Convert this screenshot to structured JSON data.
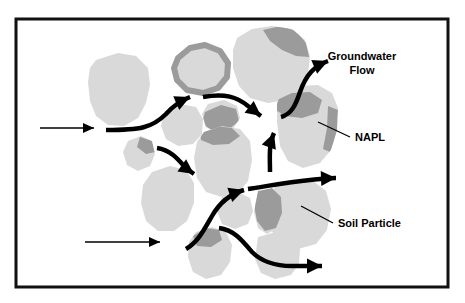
{
  "figure": {
    "border": {
      "color": "#111111",
      "fill": "#ffffff",
      "x": 16,
      "y": 19,
      "width": 432,
      "height": 268,
      "stroke_width": 3
    },
    "colors": {
      "soil_particle": "#d9d9d9",
      "napl": "#9b9b9b",
      "arrow": "#000000",
      "leader_line": "#000000",
      "text": "#000000",
      "background": "#ffffff"
    }
  },
  "labels": [
    {
      "name": "groundwater-flow",
      "lines": [
        "Groundwater",
        "Flow"
      ],
      "line1": "Groundwater",
      "line2": "Flow",
      "x": 362,
      "y": 60,
      "font_size": 11,
      "anchor": "middle",
      "has_leader": false
    },
    {
      "name": "napl",
      "line1": "NAPL",
      "x": 355,
      "y": 141,
      "font_size": 11,
      "anchor": "start",
      "has_leader": true,
      "leader": {
        "x1": 350,
        "y1": 137,
        "x2": 318,
        "y2": 122
      }
    },
    {
      "name": "soil-particle",
      "line1": "Soil Particle",
      "x": 338,
      "y": 227,
      "font_size": 11,
      "anchor": "start",
      "has_leader": true,
      "leader": {
        "x1": 333,
        "y1": 223,
        "x2": 301,
        "y2": 206
      }
    }
  ],
  "soil_particles": [
    {
      "name": "particle-left-large",
      "path": "M 96,60 L 118,53 L 136,56 L 148,68 L 150,85 L 146,103 L 138,118 L 124,126 L 108,125 L 96,116 L 90,101 L 88,82 L 90,68 Z",
      "napl_patches": []
    },
    {
      "name": "particle-top-coated-ring",
      "path": "M 178,58 L 190,48 L 205,45 L 220,51 L 228,63 L 227,77 L 218,88 L 203,93 L 187,90 L 177,80 L 174,68 Z",
      "napl_patches": [
        {
          "name": "napl-ring-coating",
          "type": "ring",
          "path": "M 178,58 L 190,48 L 205,45 L 220,51 L 228,63 L 227,77 L 218,88 L 203,93 L 187,90 L 177,80 L 174,68 Z"
        }
      ]
    },
    {
      "name": "particle-top-right-large",
      "path": "M 237,38 L 252,29 L 272,26 L 292,29 L 305,40 L 310,56 L 308,75 L 300,90 L 286,100 L 268,103 L 250,98 L 239,86 L 233,68 L 233,50 Z",
      "napl_patches": [
        {
          "name": "napl-top-right-cap",
          "type": "patch",
          "path": "M 263,30 L 281,26 L 296,31 L 306,43 L 309,57 L 296,56 L 282,50 L 270,41 Z"
        }
      ]
    },
    {
      "name": "particle-center-small",
      "path": "M 165,111 L 180,104 L 196,107 L 203,119 L 202,134 L 193,144 L 178,146 L 166,139 L 161,126 Z",
      "napl_patches": []
    },
    {
      "name": "particle-center-blob",
      "path": "M 208,104 L 224,100 L 237,106 L 240,118 L 233,129 L 218,133 L 206,127 L 202,114 Z",
      "napl_patches": [
        {
          "name": "napl-center-bridge",
          "type": "patch",
          "path": "M 205,112 L 221,105 L 236,109 L 239,121 L 228,130 L 212,131 L 202,123 Z"
        }
      ]
    },
    {
      "name": "particle-center-large",
      "path": "M 204,132 L 222,126 L 240,129 L 250,141 L 252,160 L 248,181 L 238,193 L 222,197 L 206,192 L 197,178 L 194,158 L 197,142 Z",
      "napl_patches": [
        {
          "name": "napl-center-large-top",
          "type": "patch",
          "path": "M 200,131 L 216,126 L 232,128 L 240,136 L 229,144 L 213,145 L 201,140 Z"
        }
      ]
    },
    {
      "name": "particle-left-small-mid",
      "path": "M 128,141 L 141,136 L 152,141 L 155,154 L 150,166 L 138,171 L 127,165 L 123,152 Z",
      "napl_patches": [
        {
          "name": "napl-left-small-wedge",
          "type": "patch",
          "path": "M 140,137 L 152,141 L 155,152 L 146,154 L 137,147 Z"
        }
      ]
    },
    {
      "name": "particle-lower-left-large",
      "path": "M 152,172 L 170,166 L 186,170 L 194,183 L 194,203 L 187,221 L 174,231 L 158,231 L 146,221 L 141,203 L 143,185 Z",
      "napl_patches": []
    },
    {
      "name": "particle-right-large",
      "path": "M 281,93 L 298,86 L 318,85 L 332,93 L 338,108 L 337,130 L 331,150 L 320,163 L 303,168 L 288,161 L 280,146 L 277,122 L 277,104 Z",
      "napl_patches": [
        {
          "name": "napl-right-wedge",
          "type": "patch",
          "path": "M 277,100 L 292,93 L 310,92 L 322,100 L 318,113 L 302,118 L 285,116 L 276,110 Z"
        },
        {
          "name": "napl-right-edge-strip",
          "type": "patch",
          "path": "M 328,106 L 338,110 L 337,135 L 330,152 L 323,149 L 327,128 Z"
        }
      ]
    },
    {
      "name": "particle-right-lower-large",
      "path": "M 275,186 L 293,180 L 313,181 L 326,191 L 331,209 L 327,230 L 316,244 L 298,249 L 281,244 L 271,230 L 268,209 Z",
      "napl_patches": []
    },
    {
      "name": "particle-mid-lower-small",
      "path": "M 222,197 L 238,192 L 250,198 L 253,211 L 248,224 L 235,229 L 222,224 L 217,211 Z",
      "napl_patches": []
    },
    {
      "name": "particle-napl-strip-lower",
      "path": "M 258,191 L 272,188 L 281,196 L 283,212 L 278,228 L 267,234 L 258,228 L 254,212 Z",
      "napl_patches": [
        {
          "name": "napl-lower-strip",
          "type": "patch",
          "path": "M 258,191 L 272,188 L 281,197 L 282,213 L 276,228 L 265,231 L 257,221 L 254,205 Z"
        }
      ]
    },
    {
      "name": "particle-bottom-left",
      "path": "M 196,232 L 212,227 L 226,232 L 232,245 L 230,262 L 221,275 L 206,279 L 193,272 L 188,257 L 189,242 Z",
      "napl_patches": [
        {
          "name": "napl-bottom-left-patch",
          "type": "patch",
          "path": "M 193,236 L 206,228 L 219,230 L 222,240 L 211,247 L 197,246 Z"
        }
      ]
    },
    {
      "name": "particle-bottom-right",
      "path": "M 258,237 L 276,232 L 292,236 L 300,248 L 299,264 L 291,275 L 275,279 L 261,273 L 255,259 Z",
      "napl_patches": []
    }
  ],
  "flow_arrows": [
    {
      "name": "inlet-arrow-upper",
      "type": "straight-thin",
      "path": "M 40,128 L 94,128",
      "stroke_width": 1.6,
      "arrowhead": "thin"
    },
    {
      "name": "inlet-arrow-lower",
      "type": "straight-thin",
      "path": "M 85,242 L 160,242",
      "stroke_width": 1.6,
      "arrowhead": "thin"
    },
    {
      "name": "flow-path-upper-left",
      "type": "curved-thick",
      "path": "M 106,130 C 140,130 152,128 166,114 C 174,105 182,100 190,97",
      "stroke_width": 4.5,
      "arrowhead": "thick"
    },
    {
      "name": "flow-path-upper-center",
      "type": "curved-thick",
      "path": "M 203,97 C 225,93 237,97 248,106 C 255,111 258,114 261,116",
      "stroke_width": 4.5,
      "arrowhead": "thick"
    },
    {
      "name": "flow-path-to-groundwater-label",
      "type": "curved-thick",
      "path": "M 281,117 C 292,114 296,104 300,92 C 306,75 314,66 328,61",
      "stroke_width": 4.5,
      "arrowhead": "thick"
    },
    {
      "name": "flow-path-mid-left-diagonal",
      "type": "curved-thick",
      "path": "M 157,148 C 170,150 177,158 184,166 C 188,170 191,172 194,174",
      "stroke_width": 4.5,
      "arrowhead": "thick"
    },
    {
      "name": "flow-path-vertical-up",
      "type": "curved-thick",
      "path": "M 270,172 C 270,160 269,150 271,142 C 272,138 273,135 274,133",
      "stroke_width": 4.5,
      "arrowhead": "thick"
    },
    {
      "name": "flow-path-middle-outlet",
      "type": "curved-thick",
      "path": "M 248,189 C 268,186 288,182 310,180 C 322,179 330,178 336,178",
      "stroke_width": 4.5,
      "arrowhead": "thick"
    },
    {
      "name": "flow-path-lower-center",
      "type": "curved-thick",
      "path": "M 186,249 C 198,242 204,230 212,216 C 220,202 230,194 244,190",
      "stroke_width": 4.5,
      "arrowhead": "thick"
    },
    {
      "name": "flow-path-bottom-outlet",
      "type": "curved-thick",
      "path": "M 219,228 C 234,230 242,240 252,252 C 262,262 276,266 292,266 C 306,266 316,266 322,266",
      "stroke_width": 4.5,
      "arrowhead": "thick"
    }
  ]
}
